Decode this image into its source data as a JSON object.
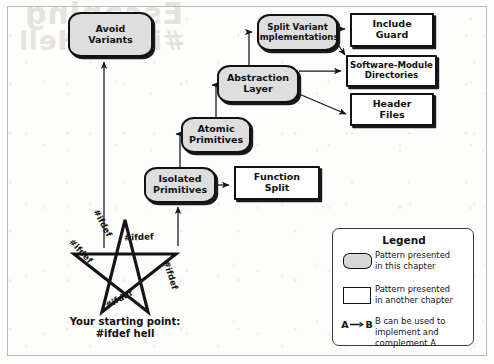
{
  "figure": {
    "background_color": "#fdfdfc",
    "frame_color": "#b9b9b9",
    "pattern_fill": "#dedede",
    "ink_color": "#121212"
  },
  "ghost_text": {
    "line1": "Escaping",
    "line2": "#ifdef Hell"
  },
  "nodes": [
    {
      "id": "avoid-variants",
      "label": "Avoid\nVariants",
      "kind": "pattern-here"
    },
    {
      "id": "split-variant",
      "label": "Split Variant\nImplementations",
      "kind": "pattern-here"
    },
    {
      "id": "abstraction-layer",
      "label": "Abstraction\nLayer",
      "kind": "pattern-here"
    },
    {
      "id": "atomic-primitives",
      "label": "Atomic\nPrimitives",
      "kind": "pattern-here"
    },
    {
      "id": "isolated-primitives",
      "label": "Isolated\nPrimitives",
      "kind": "pattern-here"
    },
    {
      "id": "include-guard",
      "label": "Include\nGuard",
      "kind": "pattern-other"
    },
    {
      "id": "software-module",
      "label": "Software-Module\nDirectories",
      "kind": "pattern-other"
    },
    {
      "id": "header-files",
      "label": "Header\nFiles",
      "kind": "pattern-other"
    },
    {
      "id": "function-split",
      "label": "Function\nSplit",
      "kind": "pattern-other"
    }
  ],
  "star": {
    "ifdef_labels": [
      "#ifdef",
      "#ifdef",
      "#ifdef",
      "#ifdef",
      "#ifdef"
    ],
    "caption": "Your starting point:\n#ifdef hell"
  },
  "legend": {
    "title": "Legend",
    "rows": [
      {
        "swatch": "rounded-gray-pill",
        "text": "Pattern presented\nin this chapter"
      },
      {
        "swatch": "white-rectangle",
        "text": "Pattern presented\nin another chapter"
      },
      {
        "swatch": "a-arrow-b",
        "text": "B can be used to\nimplement and\ncomplement A"
      }
    ],
    "ab_glyph": {
      "from": "A",
      "to": "B"
    }
  }
}
